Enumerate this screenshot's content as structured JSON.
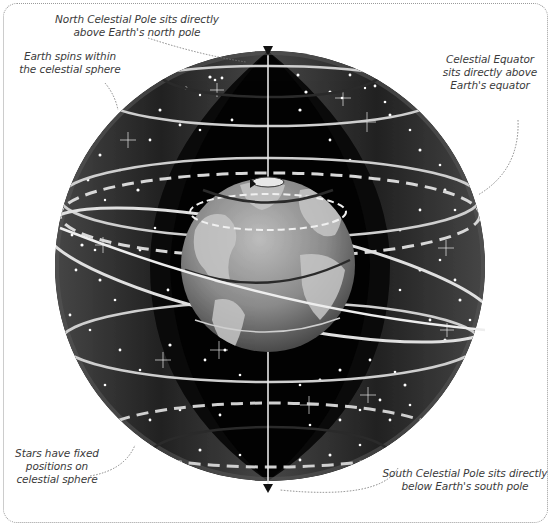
{
  "diagram": {
    "colors": {
      "sky": "#050505",
      "shell": "#4a4a4a",
      "ring": "#d8d8d8",
      "earth_land": "#c4c4c4",
      "earth_ocean": "#8e8e8e",
      "label_text": "#3a3a3a",
      "frame_border": "#9a9a9a"
    },
    "annotations": {
      "north_pole": {
        "line1": "North Celestial Pole sits directly",
        "line2": "above Earth's north pole"
      },
      "earth_spins": {
        "line1": "Earth spins within",
        "line2": "the celestial sphere"
      },
      "celestial_equator": {
        "line1": "Celestial Equator",
        "line2": "sits directly above",
        "line3": "Earth's equator"
      },
      "stars_fixed": {
        "line1": "Stars have fixed",
        "line2": "positions on",
        "line3": "celestial sphere"
      },
      "south_pole": {
        "line1": "South Celestial Pole sits directly",
        "line2": "below Earth's south pole"
      }
    },
    "icons": [
      "north-pole-arrow-icon",
      "south-pole-arrow-icon",
      "earth-globe-icon",
      "star-icon"
    ]
  }
}
